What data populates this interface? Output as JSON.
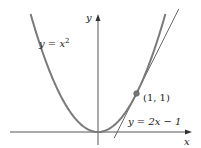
{
  "diagram": {
    "type": "function-plot",
    "origin_px": [
      98,
      132
    ],
    "unit_px": 38.5,
    "axes": {
      "x_label": "x",
      "y_label": "y",
      "color": "#555555"
    },
    "curve": {
      "label_lhs": "y = x",
      "label_exp": "2",
      "expression": "y = x^2",
      "x_range": [
        -1.75,
        1.75
      ],
      "color": "#7a7a7a"
    },
    "tangent": {
      "label": "y = 2x − 1",
      "expression": "y = 2x - 1",
      "x_range": [
        0.42,
        2.1
      ],
      "color": "#6a6a6a"
    },
    "point": {
      "label": "(1, 1)",
      "x": 1,
      "y": 1,
      "color": "#777777"
    }
  }
}
